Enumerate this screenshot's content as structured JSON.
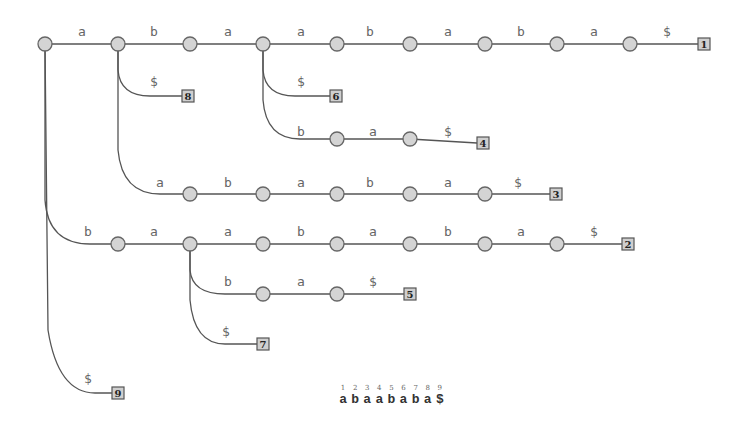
{
  "colors": {
    "edge": "#555555",
    "node_fill": "#d4d4d4",
    "leaf_fill": "#cfcfcf",
    "label": "#666666"
  },
  "string": {
    "chars": [
      {
        "index": "1",
        "char": "a"
      },
      {
        "index": "2",
        "char": "b"
      },
      {
        "index": "3",
        "char": "a"
      },
      {
        "index": "4",
        "char": "a"
      },
      {
        "index": "5",
        "char": "b"
      },
      {
        "index": "6",
        "char": "a"
      },
      {
        "index": "7",
        "char": "b"
      },
      {
        "index": "8",
        "char": "a"
      },
      {
        "index": "9",
        "char": "$"
      }
    ]
  },
  "nodes": [
    {
      "id": "root",
      "x": 45,
      "y": 44
    },
    {
      "id": "n_a",
      "x": 118,
      "y": 44
    },
    {
      "id": "n_ab",
      "x": 190,
      "y": 44
    },
    {
      "id": "n_aba",
      "x": 263,
      "y": 44
    },
    {
      "id": "n_abaa",
      "x": 337,
      "y": 44
    },
    {
      "id": "n_abaab",
      "x": 410,
      "y": 44
    },
    {
      "id": "n_abaaba",
      "x": 485,
      "y": 44
    },
    {
      "id": "n_abaabab",
      "x": 557,
      "y": 44
    },
    {
      "id": "n_abaababa",
      "x": 630,
      "y": 44
    },
    {
      "id": "n_abab",
      "x": 337,
      "y": 139
    },
    {
      "id": "n_ababa",
      "x": 410,
      "y": 139
    },
    {
      "id": "n_aa",
      "x": 190,
      "y": 194
    },
    {
      "id": "n_aab",
      "x": 263,
      "y": 194
    },
    {
      "id": "n_aaba",
      "x": 337,
      "y": 194
    },
    {
      "id": "n_aabab",
      "x": 410,
      "y": 194
    },
    {
      "id": "n_aababa",
      "x": 485,
      "y": 194
    },
    {
      "id": "n_b",
      "x": 118,
      "y": 244
    },
    {
      "id": "n_ba",
      "x": 190,
      "y": 244
    },
    {
      "id": "n_baa",
      "x": 263,
      "y": 244
    },
    {
      "id": "n_baab",
      "x": 337,
      "y": 244
    },
    {
      "id": "n_baaba",
      "x": 410,
      "y": 244
    },
    {
      "id": "n_baabab",
      "x": 485,
      "y": 244
    },
    {
      "id": "n_baababa",
      "x": 557,
      "y": 244
    },
    {
      "id": "n_bab",
      "x": 263,
      "y": 294
    },
    {
      "id": "n_baba",
      "x": 337,
      "y": 294
    }
  ],
  "leaves": [
    {
      "label": "1",
      "x": 704,
      "y": 44
    },
    {
      "label": "8",
      "x": 188,
      "y": 96
    },
    {
      "label": "6",
      "x": 336,
      "y": 96
    },
    {
      "label": "4",
      "x": 483,
      "y": 143
    },
    {
      "label": "3",
      "x": 556,
      "y": 194
    },
    {
      "label": "2",
      "x": 628,
      "y": 244
    },
    {
      "label": "5",
      "x": 410,
      "y": 294
    },
    {
      "label": "7",
      "x": 263,
      "y": 344
    },
    {
      "label": "9",
      "x": 118,
      "y": 393
    }
  ],
  "edges": [
    {
      "path": "M45 44 L118 44",
      "label": "a",
      "lx": 82,
      "ly": 36
    },
    {
      "path": "M118 44 L190 44",
      "label": "b",
      "lx": 154,
      "ly": 36
    },
    {
      "path": "M190 44 L263 44",
      "label": "a",
      "lx": 228,
      "ly": 36
    },
    {
      "path": "M263 44 L337 44",
      "label": "a",
      "lx": 301,
      "ly": 36
    },
    {
      "path": "M337 44 L410 44",
      "label": "b",
      "lx": 370,
      "ly": 36
    },
    {
      "path": "M410 44 L485 44",
      "label": "a",
      "lx": 448,
      "ly": 36
    },
    {
      "path": "M485 44 L557 44",
      "label": "b",
      "lx": 521,
      "ly": 36
    },
    {
      "path": "M557 44 L630 44",
      "label": "a",
      "lx": 594,
      "ly": 36
    },
    {
      "path": "M630 44 L698 44",
      "label": "$",
      "lx": 667,
      "ly": 36
    },
    {
      "path": "M118 44 L118 70 Q120 96 150 96 L182 96",
      "label": "$",
      "lx": 154,
      "ly": 86
    },
    {
      "path": "M263 44 L263 70 Q265 96 295 96 L330 96",
      "label": "$",
      "lx": 301,
      "ly": 86
    },
    {
      "path": "M263 44 L263 100 Q266 139 300 139 L337 139",
      "label": "b",
      "lx": 301,
      "ly": 136
    },
    {
      "path": "M337 139 L410 139",
      "label": "a",
      "lx": 373,
      "ly": 136
    },
    {
      "path": "M410 139 L477 143",
      "label": "$",
      "lx": 448,
      "ly": 136
    },
    {
      "path": "M118 44 L118 150 Q122 194 160 194 L190 194",
      "label": "a",
      "lx": 160,
      "ly": 187
    },
    {
      "path": "M190 194 L263 194",
      "label": "b",
      "lx": 228,
      "ly": 187
    },
    {
      "path": "M263 194 L337 194",
      "label": "a",
      "lx": 301,
      "ly": 187
    },
    {
      "path": "M337 194 L410 194",
      "label": "b",
      "lx": 370,
      "ly": 187
    },
    {
      "path": "M410 194 L485 194",
      "label": "a",
      "lx": 448,
      "ly": 187
    },
    {
      "path": "M485 194 L550 194",
      "label": "$",
      "lx": 518,
      "ly": 187
    },
    {
      "path": "M45 44 L45 200 Q48 244 90 244 L118 244",
      "label": "b",
      "lx": 88,
      "ly": 236
    },
    {
      "path": "M118 244 L190 244",
      "label": "a",
      "lx": 154,
      "ly": 236
    },
    {
      "path": "M190 244 L263 244",
      "label": "a",
      "lx": 228,
      "ly": 236
    },
    {
      "path": "M263 244 L337 244",
      "label": "b",
      "lx": 301,
      "ly": 236
    },
    {
      "path": "M337 244 L410 244",
      "label": "a",
      "lx": 373,
      "ly": 236
    },
    {
      "path": "M410 244 L485 244",
      "label": "b",
      "lx": 448,
      "ly": 236
    },
    {
      "path": "M485 244 L557 244",
      "label": "a",
      "lx": 521,
      "ly": 236
    },
    {
      "path": "M557 244 L622 244",
      "label": "$",
      "lx": 594,
      "ly": 236
    },
    {
      "path": "M190 244 L190 270 Q192 294 225 294 L263 294",
      "label": "b",
      "lx": 228,
      "ly": 286
    },
    {
      "path": "M263 294 L337 294",
      "label": "a",
      "lx": 301,
      "ly": 286
    },
    {
      "path": "M337 294 L404 294",
      "label": "$",
      "lx": 373,
      "ly": 286
    },
    {
      "path": "M190 244 L190 300 Q194 344 225 344 L257 344",
      "label": "$",
      "lx": 226,
      "ly": 336
    },
    {
      "path": "M45 44 L48 330 Q58 393 95 393 L112 393",
      "label": "$",
      "lx": 88,
      "ly": 383
    }
  ]
}
